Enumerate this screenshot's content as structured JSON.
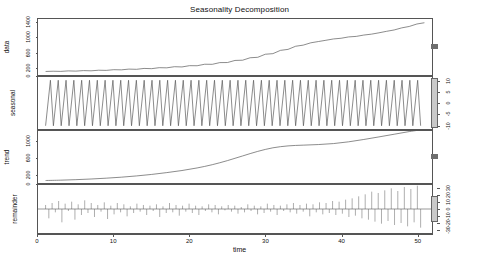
{
  "chart_data": {
    "type": "line",
    "title": "Seasonality Decomposition",
    "xlabel": "time",
    "ylabel": "",
    "grid": false,
    "legend": "none",
    "xlim": [
      0,
      52
    ],
    "x_ticks": [
      0,
      10,
      20,
      30,
      40,
      50
    ],
    "panels": [
      {
        "name": "data",
        "label": "data",
        "axis_side": "left",
        "ylim": [
          0,
          1500
        ],
        "y_ticks": [
          0,
          200,
          600,
          1000,
          1400
        ],
        "y_tick_labels": [
          "0",
          "200",
          "600",
          "1000",
          "1400"
        ],
        "scalebar_relative_height": 0.09,
        "series": [
          {
            "name": "observed",
            "x": [
              1,
              2,
              3,
              4,
              5,
              6,
              7,
              8,
              9,
              10,
              11,
              12,
              13,
              14,
              15,
              16,
              17,
              18,
              19,
              20,
              21,
              22,
              23,
              24,
              25,
              26,
              27,
              28,
              29,
              30,
              31,
              32,
              33,
              34,
              35,
              36,
              37,
              38,
              39,
              40,
              41,
              42,
              43,
              44,
              45,
              46,
              47,
              48,
              49,
              50,
              51
            ],
            "values": [
              95,
              101,
              97,
              110,
              104,
              118,
              112,
              128,
              124,
              142,
              138,
              158,
              152,
              176,
              170,
              196,
              192,
              222,
              216,
              250,
              248,
              288,
              286,
              332,
              334,
              390,
              396,
              462,
              474,
              556,
              572,
              660,
              686,
              770,
              800,
              862,
              896,
              930,
              966,
              984,
              1020,
              1034,
              1070,
              1094,
              1130,
              1170,
              1206,
              1262,
              1300,
              1366,
              1400
            ]
          }
        ]
      },
      {
        "name": "seasonal",
        "label": "seasonal",
        "axis_side": "right",
        "ylim": [
          -12,
          12
        ],
        "y_ticks": [
          -10,
          -5,
          0,
          5,
          10
        ],
        "y_tick_labels": [
          "-10",
          "-5",
          "0",
          "5",
          "10"
        ],
        "scalebar_relative_height": 0.93,
        "pattern": "sawtooth",
        "cycles": 48,
        "amplitude": 10.5,
        "series": [
          {
            "name": "seasonal-component",
            "note": "repeating sawtooth: rises steeply to +10.5 then falls to -10.5 each cycle"
          }
        ]
      },
      {
        "name": "trend",
        "label": "trend",
        "axis_side": "left",
        "ylim": [
          0,
          1250
        ],
        "y_ticks": [
          0,
          200,
          600,
          1000
        ],
        "y_tick_labels": [
          "0",
          "200",
          "600",
          "1000"
        ],
        "scalebar_relative_height": 0.09,
        "series": [
          {
            "name": "trend-component",
            "x": [
              1,
              3,
              5,
              7,
              9,
              11,
              13,
              15,
              17,
              19,
              21,
              23,
              25,
              27,
              29,
              31,
              33,
              35,
              37,
              39,
              41,
              43,
              45,
              47,
              49,
              51
            ],
            "values": [
              60,
              68,
              80,
              96,
              116,
              140,
              170,
              206,
              250,
              300,
              362,
              440,
              538,
              650,
              760,
              846,
              892,
              910,
              924,
              948,
              990,
              1046,
              1108,
              1172,
              1236,
              1290
            ]
          }
        ]
      },
      {
        "name": "remainder",
        "label": "remainder",
        "axis_side": "right",
        "ylim": [
          -36,
          36
        ],
        "y_ticks": [
          -30,
          -20,
          -10,
          0,
          10,
          20,
          30
        ],
        "y_tick_labels": [
          "-30",
          "-20",
          "-10",
          "0",
          "10",
          "20",
          "30"
        ],
        "scalebar_relative_height": 0.48,
        "plot_style": "stems",
        "series": [
          {
            "name": "remainder-component",
            "note": "vertical stems about zero; amplitude small at left, growing markedly after time 42",
            "values": [
              6,
              -14,
              9,
              -5,
              12,
              -20,
              8,
              -3,
              11,
              -16,
              7,
              -9,
              13,
              -6,
              9,
              -12,
              6,
              -4,
              10,
              -15,
              5,
              -8,
              9,
              -5,
              7,
              -11,
              4,
              -6,
              8,
              -4,
              6,
              -9,
              5,
              -3,
              7,
              -12,
              4,
              -6,
              9,
              -5,
              6,
              -10,
              5,
              -4,
              8,
              -6,
              5,
              -9,
              4,
              -3,
              7,
              -5,
              6,
              -8,
              4,
              -2,
              6,
              -4,
              5,
              -7,
              3,
              -5,
              7,
              -3,
              5,
              -8,
              4,
              -6,
              8,
              -4,
              6,
              -9,
              5,
              -3,
              7,
              -5,
              9,
              -7,
              6,
              -4,
              8,
              -11,
              7,
              -5,
              10,
              -8,
              9,
              -6,
              12,
              -9,
              11,
              -7,
              14,
              -12,
              16,
              -10,
              19,
              -14,
              22,
              -16,
              26,
              -19,
              24,
              -22,
              28,
              -18,
              31,
              -24,
              27,
              -21,
              33,
              -26,
              30,
              -20,
              35,
              -28
            ]
          }
        ]
      }
    ]
  },
  "figure": {
    "title": "Seasonality Decomposition",
    "x_axis": {
      "title": "time",
      "ticks": [
        "0",
        "10",
        "20",
        "30",
        "40",
        "50"
      ]
    },
    "rows": [
      {
        "label": "data",
        "ticks": [
          "0",
          "200",
          "600",
          "1000",
          "1400"
        ]
      },
      {
        "label": "seasonal",
        "ticks": [
          "-10",
          "-5",
          "0",
          "5",
          "10"
        ]
      },
      {
        "label": "trend",
        "ticks": [
          "0",
          "200",
          "600",
          "1000"
        ]
      },
      {
        "label": "remainder",
        "ticks": [
          "-30",
          "-20",
          "-10",
          "0",
          "10",
          "20",
          "30"
        ]
      }
    ]
  },
  "colors": {
    "line": "#5a5a5a",
    "frame": "#555555",
    "scalebar_fill": "#c9c9c9",
    "text": "#111111",
    "background": "#ffffff"
  }
}
